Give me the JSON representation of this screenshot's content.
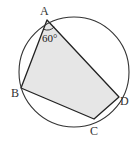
{
  "diagram": {
    "type": "inscribed-quadrilateral",
    "circle": {
      "cx": 74,
      "cy": 72,
      "r": 55
    },
    "points": {
      "A": {
        "x": 47,
        "y": 20,
        "label": "A",
        "lx": 40,
        "ly": 15
      },
      "B": {
        "x": 21,
        "y": 88,
        "label": "B",
        "lx": 11,
        "ly": 97
      },
      "C": {
        "x": 94,
        "y": 119,
        "label": "C",
        "lx": 90,
        "ly": 135
      },
      "D": {
        "x": 119,
        "y": 97,
        "label": "D",
        "lx": 120,
        "ly": 105
      }
    },
    "angle": {
      "vertex": "A",
      "value_label": "60°",
      "lx": 43,
      "ly": 42
    },
    "colors": {
      "fill": "#e6e6e6",
      "stroke": "#222222",
      "circle_stroke": "#333333"
    }
  }
}
